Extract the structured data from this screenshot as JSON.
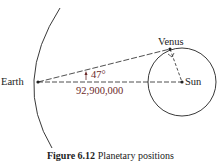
{
  "diagram": {
    "labels": {
      "earth": "Earth",
      "venus": "Venus",
      "sun": "Sun",
      "angle": "47°",
      "distance": "92,900,000"
    },
    "colors": {
      "lines": "#222222",
      "annotation": "#6b2a2a"
    }
  },
  "caption": {
    "number": "Figure 6.12",
    "text": "Planetary positions"
  }
}
